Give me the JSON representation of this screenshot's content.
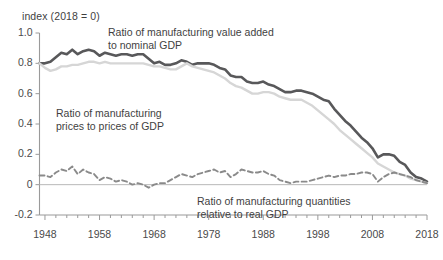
{
  "chart_data": {
    "type": "line",
    "title": "",
    "ylabel": "index (2018 = 0)",
    "xlabel": "",
    "grid": false,
    "legend_position": "inline-annotations",
    "xlim": [
      1947,
      2018
    ],
    "ylim": [
      -0.2,
      1.0
    ],
    "yticks": [
      "1.0",
      "0.8",
      "0.6",
      "0.4",
      "0.2",
      "0",
      "-0.2"
    ],
    "ytick_values": [
      1.0,
      0.8,
      0.6,
      0.4,
      0.2,
      0,
      -0.2
    ],
    "xticks": [
      "1948",
      "1958",
      "1968",
      "1978",
      "1988",
      "1998",
      "2008",
      "2018"
    ],
    "xtick_values": [
      1948,
      1958,
      1968,
      1978,
      1988,
      1998,
      2008,
      2018
    ],
    "minor_xtick_step": 2,
    "zero_line": 0,
    "series": [
      {
        "name": "Ratio of manufacturing value added to nominal GDP",
        "style": "solid",
        "color": "#58585a",
        "x": [
          1947,
          1948,
          1949,
          1950,
          1951,
          1952,
          1953,
          1954,
          1955,
          1956,
          1957,
          1958,
          1959,
          1960,
          1961,
          1962,
          1963,
          1964,
          1965,
          1966,
          1967,
          1968,
          1969,
          1970,
          1971,
          1972,
          1973,
          1974,
          1975,
          1976,
          1977,
          1978,
          1979,
          1980,
          1981,
          1982,
          1983,
          1984,
          1985,
          1986,
          1987,
          1988,
          1989,
          1990,
          1991,
          1992,
          1993,
          1994,
          1995,
          1996,
          1997,
          1998,
          1999,
          2000,
          2001,
          2002,
          2003,
          2004,
          2005,
          2006,
          2007,
          2008,
          2009,
          2010,
          2011,
          2012,
          2013,
          2014,
          2015,
          2016,
          2017,
          2018
        ],
        "values": [
          0.8,
          0.8,
          0.81,
          0.84,
          0.87,
          0.86,
          0.89,
          0.86,
          0.88,
          0.89,
          0.88,
          0.85,
          0.87,
          0.86,
          0.85,
          0.86,
          0.86,
          0.85,
          0.86,
          0.86,
          0.83,
          0.8,
          0.81,
          0.79,
          0.79,
          0.8,
          0.82,
          0.81,
          0.79,
          0.8,
          0.8,
          0.8,
          0.79,
          0.77,
          0.76,
          0.72,
          0.71,
          0.71,
          0.68,
          0.67,
          0.67,
          0.68,
          0.66,
          0.65,
          0.63,
          0.61,
          0.61,
          0.62,
          0.62,
          0.61,
          0.6,
          0.58,
          0.56,
          0.55,
          0.5,
          0.46,
          0.42,
          0.39,
          0.35,
          0.31,
          0.28,
          0.24,
          0.18,
          0.2,
          0.2,
          0.19,
          0.15,
          0.13,
          0.08,
          0.05,
          0.04,
          0.02
        ]
      },
      {
        "name": "Ratio of manufacturing prices to prices of GDP",
        "style": "solid-light",
        "color": "#d6d6d6",
        "x": [
          1947,
          1948,
          1949,
          1950,
          1951,
          1952,
          1953,
          1954,
          1955,
          1956,
          1957,
          1958,
          1959,
          1960,
          1961,
          1962,
          1963,
          1964,
          1965,
          1966,
          1967,
          1968,
          1969,
          1970,
          1971,
          1972,
          1973,
          1974,
          1975,
          1976,
          1977,
          1978,
          1979,
          1980,
          1981,
          1982,
          1983,
          1984,
          1985,
          1986,
          1987,
          1988,
          1989,
          1990,
          1991,
          1992,
          1993,
          1994,
          1995,
          1996,
          1997,
          1998,
          1999,
          2000,
          2001,
          2002,
          2003,
          2004,
          2005,
          2006,
          2007,
          2008,
          2009,
          2010,
          2011,
          2012,
          2013,
          2014,
          2015,
          2016,
          2017,
          2018
        ],
        "values": [
          0.8,
          0.77,
          0.75,
          0.76,
          0.78,
          0.78,
          0.79,
          0.79,
          0.8,
          0.81,
          0.81,
          0.8,
          0.81,
          0.8,
          0.8,
          0.8,
          0.8,
          0.8,
          0.8,
          0.8,
          0.79,
          0.78,
          0.78,
          0.77,
          0.76,
          0.76,
          0.78,
          0.8,
          0.78,
          0.77,
          0.76,
          0.75,
          0.74,
          0.72,
          0.7,
          0.67,
          0.65,
          0.64,
          0.62,
          0.6,
          0.6,
          0.61,
          0.61,
          0.6,
          0.58,
          0.57,
          0.56,
          0.56,
          0.56,
          0.54,
          0.52,
          0.49,
          0.46,
          0.43,
          0.4,
          0.36,
          0.33,
          0.3,
          0.27,
          0.24,
          0.21,
          0.18,
          0.14,
          0.12,
          0.1,
          0.08,
          0.07,
          0.06,
          0.04,
          0.03,
          0.02,
          0.01
        ]
      },
      {
        "name": "Ratio of manufacturing quantities relative to real GDP",
        "style": "dashed",
        "color": "#8a8a8a",
        "x": [
          1947,
          1948,
          1949,
          1950,
          1951,
          1952,
          1953,
          1954,
          1955,
          1956,
          1957,
          1958,
          1959,
          1960,
          1961,
          1962,
          1963,
          1964,
          1965,
          1966,
          1967,
          1968,
          1969,
          1970,
          1971,
          1972,
          1973,
          1974,
          1975,
          1976,
          1977,
          1978,
          1979,
          1980,
          1981,
          1982,
          1983,
          1984,
          1985,
          1986,
          1987,
          1988,
          1989,
          1990,
          1991,
          1992,
          1993,
          1994,
          1995,
          1996,
          1997,
          1998,
          1999,
          2000,
          2001,
          2002,
          2003,
          2004,
          2005,
          2006,
          2007,
          2008,
          2009,
          2010,
          2011,
          2012,
          2013,
          2014,
          2015,
          2016,
          2017,
          2018
        ],
        "values": [
          0.06,
          0.06,
          0.05,
          0.08,
          0.1,
          0.09,
          0.12,
          0.07,
          0.1,
          0.08,
          0.07,
          0.03,
          0.05,
          0.04,
          0.02,
          0.03,
          0.02,
          0.0,
          0.01,
          0.0,
          -0.02,
          0.0,
          0.01,
          0.01,
          0.03,
          0.05,
          0.07,
          0.06,
          0.05,
          0.07,
          0.08,
          0.09,
          0.1,
          0.08,
          0.09,
          0.05,
          0.07,
          0.1,
          0.09,
          0.08,
          0.08,
          0.09,
          0.07,
          0.06,
          0.03,
          0.02,
          0.01,
          0.02,
          0.02,
          0.02,
          0.03,
          0.04,
          0.05,
          0.06,
          0.05,
          0.06,
          0.06,
          0.07,
          0.07,
          0.08,
          0.08,
          0.07,
          0.02,
          0.05,
          0.07,
          0.08,
          0.07,
          0.06,
          0.05,
          0.03,
          0.02,
          0.01
        ]
      }
    ],
    "annotations": [
      {
        "id": "annot-value-added",
        "text": "Ratio of manufacturing value added\nto nominal GDP",
        "x": 108,
        "y": 26
      },
      {
        "id": "annot-prices",
        "text": "Ratio of manufacturing\nprices to prices of GDP",
        "x": 56,
        "y": 107
      },
      {
        "id": "annot-quantities",
        "text": "Ratio of manufacturing quantities\nrelative to real GDP",
        "x": 197,
        "y": 195
      }
    ]
  },
  "colors": {
    "value_added": "#58585a",
    "prices": "#d6d6d6",
    "quantities": "#8a8a8a",
    "axis": "#9a9a9a",
    "text": "#3f3f3f",
    "background": "#ffffff"
  }
}
